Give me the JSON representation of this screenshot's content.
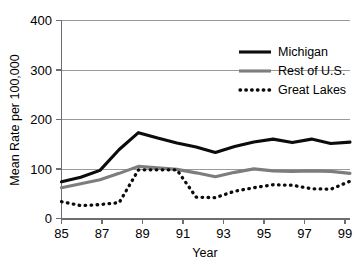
{
  "chart_data": {
    "type": "line",
    "title": "",
    "xlabel": "Year",
    "ylabel": "Mean Rate per 100,000",
    "xlim": [
      85,
      100
    ],
    "ylim": [
      0,
      400
    ],
    "grid": true,
    "legend_position": "top-right",
    "x": [
      85,
      86,
      87,
      88,
      89,
      90,
      91,
      92,
      93,
      94,
      95,
      96,
      97,
      98,
      99,
      100
    ],
    "xtick_values": [
      85,
      87,
      89,
      91,
      93,
      95,
      97,
      99
    ],
    "xtick_labels": [
      "85",
      "87",
      "89",
      "91",
      "93",
      "95",
      "97",
      "99"
    ],
    "ytick_values": [
      0,
      100,
      200,
      300,
      400
    ],
    "ytick_labels": [
      "0",
      "100",
      "200",
      "300",
      "400"
    ],
    "series": [
      {
        "name": "Michigan",
        "color": "#0c0c0c",
        "style": "solid",
        "values": [
          75,
          84,
          98,
          140,
          174,
          163,
          153,
          145,
          134,
          146,
          155,
          161,
          154,
          161,
          152,
          155
        ]
      },
      {
        "name": "Rest of U.S.",
        "color": "#7d7d7d",
        "style": "solid",
        "values": [
          63,
          71,
          79,
          92,
          106,
          103,
          100,
          93,
          85,
          94,
          101,
          97,
          96,
          97,
          96,
          92
        ]
      },
      {
        "name": "Great Lakes",
        "color": "#0c0c0c",
        "style": "dotted",
        "values": [
          35,
          27,
          29,
          33,
          99,
          99,
          99,
          44,
          43,
          56,
          63,
          69,
          68,
          61,
          60,
          76
        ]
      }
    ]
  },
  "legend": {
    "items": [
      {
        "label": "Michigan"
      },
      {
        "label": "Rest of U.S."
      },
      {
        "label": "Great Lakes"
      }
    ]
  },
  "axes": {
    "y_title": "Mean Rate per 100,000",
    "x_title": "Year"
  }
}
